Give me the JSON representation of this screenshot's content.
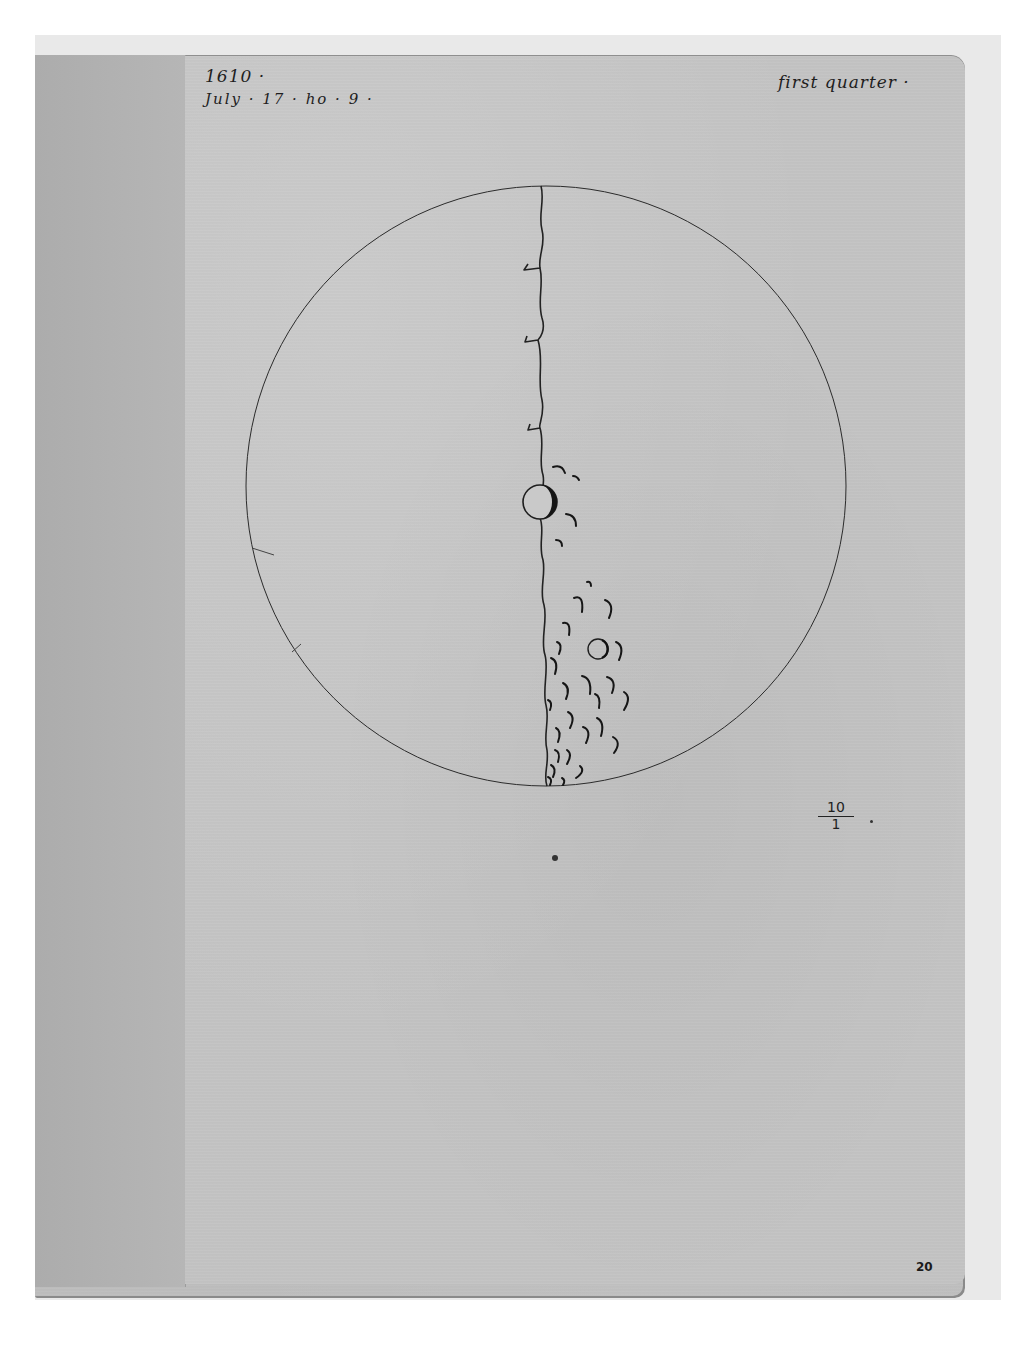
{
  "document": {
    "type": "manuscript-folio",
    "subject": "telescopic drawing of the Moon at first quarter"
  },
  "annotations": {
    "year": "1610 ·",
    "date": "July · 17 · ho · 9 ·",
    "phase": "first quarter ·",
    "magnification_numerator": "10",
    "magnification_denominator": "1",
    "folio_number": "20"
  },
  "drawing": {
    "disc": {
      "cx": 546,
      "cy": 486,
      "r": 300
    },
    "terminator": "irregular vertical line from top to bottom of disc, slightly right of center",
    "features": [
      {
        "kind": "large-crater",
        "cx": 540,
        "cy": 502,
        "r": 17
      },
      {
        "kind": "crater",
        "cx": 598,
        "cy": 649,
        "r": 10
      },
      {
        "kind": "crescent-craters",
        "count": 28,
        "region": "lower-right of terminator"
      }
    ]
  },
  "colors": {
    "background": "#ffffff",
    "mount": "#e9e9e9",
    "paper": "#c3c3c3",
    "guard_strip": "#b3b3b3",
    "ink": "#1e1e1e"
  }
}
